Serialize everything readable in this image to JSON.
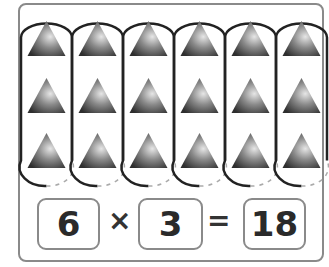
{
  "figure": {
    "groups": 6,
    "items_per_group": 3,
    "item_shape": "triangle",
    "item_color_dark": "#3a3a3a",
    "item_color_light": "#d8d8d8",
    "oval_stroke": "#222222",
    "frame_stroke": "#8a8a8a"
  },
  "equation": {
    "factor1": "6",
    "times": "×",
    "factor2": "3",
    "equals": "=",
    "product": "18"
  }
}
